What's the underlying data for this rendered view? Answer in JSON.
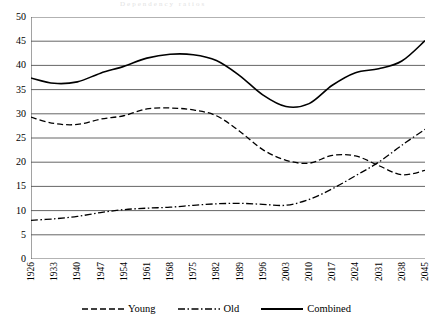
{
  "faint_title": "Dependency ratios",
  "chart_data": {
    "type": "line",
    "title": "",
    "xlabel": "",
    "ylabel": "",
    "xlim": [
      1926,
      2045
    ],
    "ylim": [
      0,
      50
    ],
    "ytick_step": 5,
    "grid": true,
    "legend_position": "bottom",
    "categories": [
      1926,
      1933,
      1940,
      1947,
      1954,
      1961,
      1968,
      1975,
      1982,
      1989,
      1996,
      2003,
      2010,
      2017,
      2024,
      2031,
      2038,
      2045
    ],
    "yticks": [
      0,
      5,
      10,
      15,
      20,
      25,
      30,
      35,
      40,
      45,
      50
    ],
    "xticks": [
      1926,
      1933,
      1940,
      1947,
      1954,
      1961,
      1968,
      1975,
      1982,
      1989,
      1996,
      2003,
      2010,
      2017,
      2024,
      2031,
      2038,
      2045
    ],
    "series": [
      {
        "name": "Young",
        "style": "dashed",
        "color": "#000000",
        "values": [
          29.3,
          28.0,
          27.8,
          28.9,
          29.6,
          31.0,
          31.2,
          30.8,
          29.6,
          26.4,
          22.6,
          20.4,
          19.8,
          21.4,
          21.3,
          19.3,
          17.4,
          18.3
        ]
      },
      {
        "name": "Old",
        "style": "dash-dot",
        "color": "#000000",
        "values": [
          8.0,
          8.3,
          8.8,
          9.6,
          10.2,
          10.5,
          10.7,
          11.1,
          11.4,
          11.5,
          11.3,
          11.1,
          12.3,
          14.5,
          17.2,
          20.0,
          23.5,
          26.8
        ]
      },
      {
        "name": "Combined",
        "style": "solid",
        "color": "#000000",
        "values": [
          37.4,
          36.3,
          36.6,
          38.4,
          39.8,
          41.5,
          42.3,
          42.2,
          41.0,
          37.9,
          33.9,
          31.5,
          32.1,
          35.9,
          38.5,
          39.3,
          40.9,
          45.1
        ]
      }
    ]
  },
  "legend": {
    "items": [
      {
        "label": "Young",
        "style": "dashed"
      },
      {
        "label": "Old",
        "style": "dash-dot"
      },
      {
        "label": "Combined",
        "style": "solid"
      }
    ]
  }
}
